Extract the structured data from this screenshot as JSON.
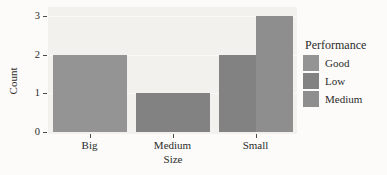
{
  "figure": {
    "background": "#fcfbf9",
    "panel_background": "#f3f1ee",
    "text_color": "#2b2b2b",
    "tick_color": "#4a4a4a"
  },
  "chart_data": {
    "type": "bar",
    "title": "",
    "xlabel": "Size",
    "ylabel": "Count",
    "categories": [
      "Big",
      "Medium",
      "Small"
    ],
    "series": [
      {
        "name": "Good",
        "color": "#949494",
        "values": [
          2,
          null,
          null
        ]
      },
      {
        "name": "Low",
        "color": "#828282",
        "values": [
          null,
          1,
          2
        ]
      },
      {
        "name": "Medium",
        "color": "#8e8e8e",
        "values": [
          null,
          null,
          3
        ]
      }
    ],
    "ylim": [
      0,
      3
    ],
    "yticks": [
      0,
      1,
      2,
      3
    ],
    "grid": false,
    "bar_layout": "dodge",
    "legend": {
      "title": "Performance",
      "position": "right"
    }
  }
}
